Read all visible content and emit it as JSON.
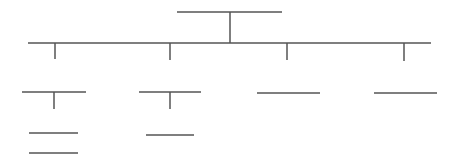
{
  "diagram": {
    "type": "org-chart-skeleton",
    "line_color": "#555555",
    "line_width": 1.5,
    "root": {
      "x1": 177,
      "x2": 282,
      "y": 12,
      "stem_x": 230,
      "stem_y2": 43
    },
    "bus": {
      "x1": 28,
      "x2": 431,
      "y": 43
    },
    "level1": [
      {
        "drop_x": 55,
        "drop_y2": 59,
        "box": {
          "x1": 22,
          "x2": 86,
          "y": 92
        },
        "stem": {
          "x": 54,
          "y2": 109
        },
        "children": [
          {
            "x1": 29,
            "x2": 78,
            "y": 133
          },
          {
            "x1": 29,
            "x2": 78,
            "y": 153
          }
        ]
      },
      {
        "drop_x": 170,
        "drop_y2": 60,
        "box": {
          "x1": 139,
          "x2": 201,
          "y": 92
        },
        "stem": {
          "x": 170,
          "y2": 109
        },
        "children": [
          {
            "x1": 146,
            "x2": 194,
            "y": 135
          }
        ]
      },
      {
        "drop_x": 287,
        "drop_y2": 60,
        "box": {
          "x1": 257,
          "x2": 320,
          "y": 93
        },
        "stem": null,
        "children": []
      },
      {
        "drop_x": 404,
        "drop_y2": 61,
        "box": {
          "x1": 374,
          "x2": 437,
          "y": 93
        },
        "stem": null,
        "children": []
      }
    ]
  }
}
